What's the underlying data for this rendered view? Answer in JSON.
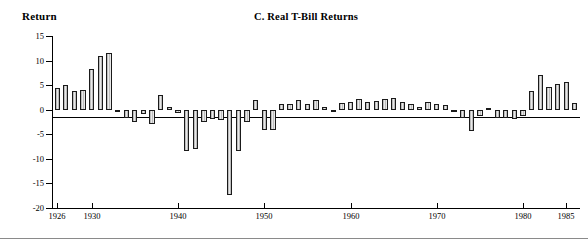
{
  "chart_data": {
    "type": "bar",
    "title": "C.  Real T-Bill Returns",
    "ylabel": "Return",
    "xlabel": "",
    "ylim": [
      -20,
      15
    ],
    "yticks": [
      15,
      10,
      5,
      0,
      -5,
      -10,
      -15,
      -20
    ],
    "xticks": [
      1926,
      1930,
      1940,
      1950,
      1960,
      1970,
      1980,
      1985
    ],
    "xlim": [
      1925.4,
      1986.6
    ],
    "grid": false,
    "legend": null,
    "bar_fill": "#d2d2d2",
    "bar_edge": "#1a1a1a",
    "categories": [
      1926,
      1927,
      1928,
      1929,
      1930,
      1931,
      1932,
      1933,
      1934,
      1935,
      1936,
      1937,
      1938,
      1939,
      1940,
      1941,
      1942,
      1943,
      1944,
      1945,
      1946,
      1947,
      1948,
      1949,
      1950,
      1951,
      1952,
      1953,
      1954,
      1955,
      1956,
      1957,
      1958,
      1959,
      1960,
      1961,
      1962,
      1963,
      1964,
      1965,
      1966,
      1967,
      1968,
      1969,
      1970,
      1971,
      1972,
      1973,
      1974,
      1975,
      1976,
      1977,
      1978,
      1979,
      1980,
      1981,
      1982,
      1983,
      1984,
      1985,
      1986
    ],
    "values": [
      4.5,
      5.0,
      3.8,
      4.1,
      8.2,
      11.0,
      11.5,
      -0.3,
      -1.6,
      -2.6,
      -0.9,
      -2.9,
      3.0,
      0.6,
      -0.7,
      -8.4,
      -8.0,
      -2.6,
      -1.9,
      -2.0,
      -17.4,
      -8.5,
      -2.5,
      2.0,
      -4.1,
      -4.1,
      1.1,
      1.1,
      2.0,
      1.2,
      2.0,
      0.5,
      -0.2,
      1.4,
      1.5,
      2.2,
      1.5,
      1.8,
      2.2,
      2.3,
      1.5,
      1.1,
      0.6,
      1.6,
      1.1,
      1.0,
      -0.4,
      -1.7,
      -4.3,
      -1.2,
      0.3,
      -1.6,
      -1.7,
      -1.8,
      -1.3,
      3.8,
      7.0,
      4.7,
      5.2,
      5.6,
      1.3
    ]
  },
  "axis": {
    "ytick_labels": [
      "15",
      "10",
      "5",
      "0",
      "-5",
      "-10",
      "-15",
      "-20"
    ],
    "xtick_labels": [
      "1926",
      "1930",
      "1940",
      "1950",
      "1960",
      "1970",
      "1980",
      "1985"
    ]
  }
}
